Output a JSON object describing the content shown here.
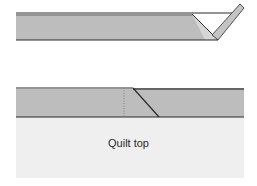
{
  "diagram": {
    "colors": {
      "strip_fill": "#bdbdbd",
      "strip_edge": "#2b2b2b",
      "quilt_top_fill": "#efefef",
      "fold_fill": "#ffffff"
    },
    "top_figure": {
      "description": "Binding strip with end folded back at 45 degrees"
    },
    "bottom_figure": {
      "description": "Binding strip laid on quilt top with diagonal overlap and dotted fold line",
      "quilt_top_label": "Quilt top"
    }
  }
}
